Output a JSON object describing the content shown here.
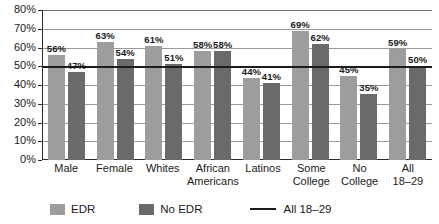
{
  "chart_data": {
    "type": "bar",
    "title": "",
    "xlabel": "",
    "ylabel": "",
    "ylim": [
      0,
      80
    ],
    "grid": true,
    "legend_position": "bottom",
    "categories": [
      "Male",
      "Female",
      "Whites",
      "African Americans",
      "Latinos",
      "Some College",
      "No College",
      "All 18-29"
    ],
    "category_lines": [
      [
        "Male"
      ],
      [
        "Female"
      ],
      [
        "Whites"
      ],
      [
        "African",
        "Americans"
      ],
      [
        "Latinos"
      ],
      [
        "Some",
        "College"
      ],
      [
        "No",
        "College"
      ],
      [
        "All",
        "18–29"
      ]
    ],
    "series": [
      {
        "name": "EDR",
        "color": "#9d9d9d",
        "values": [
          56,
          63,
          61,
          58,
          44,
          69,
          45,
          59
        ],
        "labels": [
          "56%",
          "63%",
          "61%",
          "58%",
          "44%",
          "69%",
          "45%",
          "59%"
        ]
      },
      {
        "name": "No EDR",
        "color": "#6a6a6a",
        "values": [
          47,
          54,
          51,
          58,
          41,
          62,
          35,
          50
        ],
        "labels": [
          "47%",
          "54%",
          "51%",
          "58%",
          "41%",
          "62%",
          "35%",
          "50%"
        ]
      }
    ],
    "reference_line": {
      "name": "All 18-29",
      "value": 50,
      "color": "#1c1c1c"
    },
    "ytick_labels": [
      "80%",
      "70%",
      "60%",
      "50%",
      "40%",
      "30%",
      "20%",
      "10%",
      "0%"
    ],
    "ytick_values": [
      80,
      70,
      60,
      50,
      40,
      30,
      20,
      10,
      0
    ]
  },
  "legend": {
    "items": [
      {
        "label": "EDR",
        "type": "swatch"
      },
      {
        "label": "No EDR",
        "type": "swatch"
      },
      {
        "label": "All 18–29",
        "type": "line"
      }
    ]
  }
}
